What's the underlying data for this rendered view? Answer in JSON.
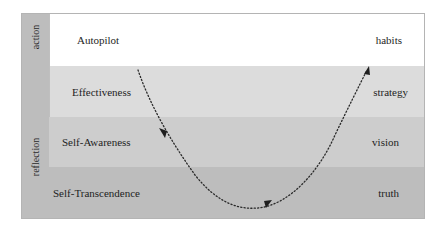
{
  "sidebar": {
    "top_label": "action",
    "bottom_label": "reflection"
  },
  "levels": [
    {
      "left": "Autopilot",
      "right": "habits",
      "color": "#ffffff"
    },
    {
      "left": "Effectiveness",
      "right": "strategy",
      "color": "#dcdcdc"
    },
    {
      "left": "Self-Awareness",
      "right": "vision",
      "color": "#cdcdcd"
    },
    {
      "left": "Self-Transcendence",
      "right": "truth",
      "color": "#bdbdbd"
    }
  ],
  "curve": {
    "style": "dotted",
    "direction": "down from Autopilot through Self-Transcendence then up to habits",
    "arrowheads": 3
  }
}
